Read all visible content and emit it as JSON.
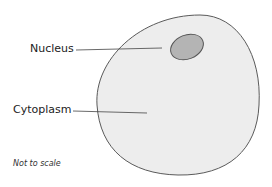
{
  "diagram": {
    "labels": {
      "nucleus": "Nucleus",
      "cytoplasm": "Cytoplasm"
    },
    "note": "Not to scale",
    "colors": {
      "cell_fill": "#ededed",
      "cell_stroke": "#5a5a5a",
      "nucleus_fill": "#b4b4b4",
      "nucleus_stroke": "#555555",
      "leader_line": "#444444"
    }
  }
}
